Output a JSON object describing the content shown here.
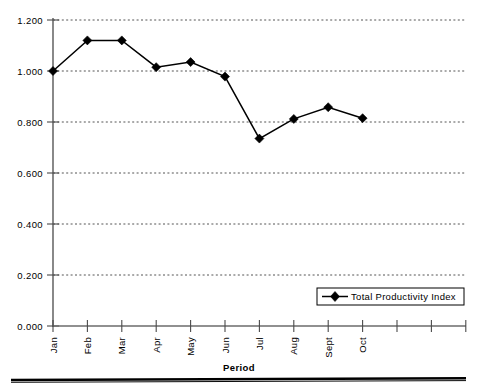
{
  "chart_data": {
    "type": "line",
    "title": "",
    "subtitle": "",
    "xlabel": "Period",
    "ylabel": "",
    "categories": [
      "Jan",
      "Feb",
      "Mar",
      "Apr",
      "May",
      "Jun",
      "Jul",
      "Aug",
      "Sept",
      "Oct"
    ],
    "extra_unlabeled_ticks": 3,
    "series": [
      {
        "name": "Total Productivity Index",
        "marker": "diamond",
        "color": "#000000",
        "values": [
          1.0,
          1.12,
          1.12,
          1.015,
          1.035,
          0.978,
          0.735,
          0.812,
          0.858,
          0.815
        ]
      }
    ],
    "ylim": [
      0.0,
      1.2
    ],
    "ytick_values": [
      0.0,
      0.2,
      0.4,
      0.6,
      0.8,
      1.0,
      1.2
    ],
    "ytick_labels": [
      "0.000",
      "0.200",
      "0.400",
      "0.600",
      "0.800",
      "1.000",
      "1.200"
    ],
    "grid": "horizontal-dotted",
    "legend_position": "bottom-right-inside",
    "legend_entries": [
      "Total Productivity Index"
    ]
  },
  "axes": {
    "y_axis_name": "value-axis",
    "x_axis_name": "period-axis"
  },
  "footer": {
    "rule": ""
  }
}
